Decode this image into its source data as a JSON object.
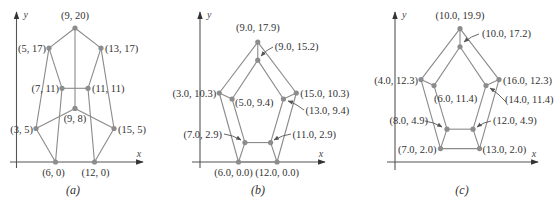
{
  "figure": {
    "panels": [
      {
        "id": "a",
        "caption": "(a)",
        "axes": {
          "x_label": "x",
          "y_label": "y"
        },
        "origin_px": [
          16.5,
          162
        ],
        "scale_px": [
          6.5,
          6.7
        ],
        "axis_px": {
          "x": [
            10,
            143
          ],
          "y": [
            12,
            168
          ]
        },
        "points": [
          {
            "key": "p1",
            "x": 9,
            "y": 20,
            "label": "(9, 20)",
            "lx": 0,
            "ly": -9,
            "anchor": "middle"
          },
          {
            "key": "p2",
            "x": 5,
            "y": 17,
            "label": "(5, 17)",
            "lx": -3,
            "ly": 4,
            "anchor": "end"
          },
          {
            "key": "p3",
            "x": 13,
            "y": 17,
            "label": "(13, 17)",
            "lx": 4,
            "ly": 4,
            "anchor": "start"
          },
          {
            "key": "p4",
            "x": 7,
            "y": 11,
            "label": "(7, 11)",
            "lx": -3,
            "ly": 4,
            "anchor": "end"
          },
          {
            "key": "p5",
            "x": 11,
            "y": 11,
            "label": "(11, 11)",
            "lx": 4,
            "ly": 4,
            "anchor": "start"
          },
          {
            "key": "p6",
            "x": 9,
            "y": 8,
            "label": "(9, 8)",
            "lx": 0,
            "ly": 14,
            "anchor": "middle"
          },
          {
            "key": "p7",
            "x": 3,
            "y": 5,
            "label": "(3, 5)",
            "lx": -3,
            "ly": 4,
            "anchor": "end"
          },
          {
            "key": "p8",
            "x": 15,
            "y": 5,
            "label": "(15, 5)",
            "lx": 4,
            "ly": 4,
            "anchor": "start"
          },
          {
            "key": "p9",
            "x": 6,
            "y": 0,
            "label": "(6, 0)",
            "lx": -2,
            "ly": 14,
            "anchor": "middle"
          },
          {
            "key": "p10",
            "x": 12,
            "y": 0,
            "label": "(12, 0)",
            "lx": 1,
            "ly": 14,
            "anchor": "middle"
          }
        ],
        "edges": [
          [
            "p1",
            "p2"
          ],
          [
            "p1",
            "p3"
          ],
          [
            "p1",
            "p6"
          ],
          [
            "p2",
            "p7"
          ],
          [
            "p2",
            "p4"
          ],
          [
            "p3",
            "p8"
          ],
          [
            "p3",
            "p5"
          ],
          [
            "p4",
            "p5"
          ],
          [
            "p4",
            "p9"
          ],
          [
            "p5",
            "p10"
          ],
          [
            "p7",
            "p6"
          ],
          [
            "p6",
            "p8"
          ],
          [
            "p7",
            "p9"
          ],
          [
            "p8",
            "p10"
          ]
        ],
        "arrows": []
      },
      {
        "id": "b",
        "caption": "(b)",
        "axes": {
          "x_label": "x",
          "y_label": "y"
        },
        "origin_px": [
          200,
          162
        ],
        "scale_px": [
          6.42,
          6.7
        ],
        "axis_px": {
          "x": [
            192,
            325
          ],
          "y": [
            12,
            168
          ]
        },
        "points": [
          {
            "key": "q1",
            "x": 9.0,
            "y": 17.9,
            "label": "(9.0, 17.9)",
            "lx": 0,
            "ly": -11,
            "anchor": "middle"
          },
          {
            "key": "q2",
            "x": 9.0,
            "y": 15.2,
            "label": "(9.0, 15.2)",
            "lx": 17,
            "ly": -10,
            "anchor": "start"
          },
          {
            "key": "q3",
            "x": 3.0,
            "y": 10.3,
            "label": "(3.0, 10.3)",
            "lx": -3,
            "ly": 4,
            "anchor": "end"
          },
          {
            "key": "q4",
            "x": 15.0,
            "y": 10.3,
            "label": "(15.0, 10.3)",
            "lx": 4,
            "ly": 4,
            "anchor": "start"
          },
          {
            "key": "q5",
            "x": 5.0,
            "y": 9.4,
            "label": "(5.0, 9.4)",
            "lx": 3,
            "ly": 7,
            "anchor": "start"
          },
          {
            "key": "q6",
            "x": 13.0,
            "y": 9.4,
            "label": "(13.0, 9.4)",
            "lx": 22,
            "ly": 15,
            "anchor": "start"
          },
          {
            "key": "q7",
            "x": 7.0,
            "y": 2.9,
            "label": "(7.0, 2.9)",
            "lx": -23,
            "ly": -5,
            "anchor": "end"
          },
          {
            "key": "q8",
            "x": 11.0,
            "y": 2.9,
            "label": "(11.0, 2.9)",
            "lx": 22,
            "ly": -5,
            "anchor": "start"
          },
          {
            "key": "q9",
            "x": 6.0,
            "y": 0.0,
            "label": "(6.0, 0.0)",
            "lx": -5,
            "ly": 14,
            "anchor": "middle"
          },
          {
            "key": "q10",
            "x": 12.0,
            "y": 0.0,
            "label": "(12.0, 0.0)",
            "lx": 0,
            "ly": 14,
            "anchor": "middle"
          }
        ],
        "edges": [
          [
            "q1",
            "q3"
          ],
          [
            "q3",
            "q9"
          ],
          [
            "q9",
            "q10"
          ],
          [
            "q10",
            "q4"
          ],
          [
            "q4",
            "q1"
          ],
          [
            "q2",
            "q5"
          ],
          [
            "q5",
            "q7"
          ],
          [
            "q7",
            "q8"
          ],
          [
            "q8",
            "q6"
          ],
          [
            "q6",
            "q2"
          ],
          [
            "q1",
            "q2"
          ],
          [
            "q3",
            "q5"
          ],
          [
            "q4",
            "q6"
          ],
          [
            "q7",
            "q9"
          ],
          [
            "q8",
            "q10"
          ]
        ],
        "arrows": [
          {
            "from": [
              273,
              47
            ],
            "to": [
              261,
              56
            ]
          },
          {
            "from": [
              304,
              110
            ],
            "to": [
              288,
              101
            ]
          },
          {
            "from": [
              224,
              134
            ],
            "to": [
              241,
              140
            ]
          },
          {
            "from": [
              291,
              134
            ],
            "to": [
              274,
              140
            ]
          }
        ]
      },
      {
        "id": "c",
        "caption": "(c)",
        "axes": {
          "x_label": "x",
          "y_label": "y"
        },
        "origin_px": [
          395,
          162
        ],
        "scale_px": [
          6.5,
          6.7
        ],
        "axis_px": {
          "x": [
            387,
            538
          ],
          "y": [
            12,
            170
          ]
        },
        "points": [
          {
            "key": "r1",
            "x": 10.0,
            "y": 19.9,
            "label": "(10.0, 19.9)",
            "lx": 0,
            "ly": -10,
            "anchor": "middle"
          },
          {
            "key": "r2",
            "x": 10.0,
            "y": 17.2,
            "label": "(10.0, 17.2)",
            "lx": 22,
            "ly": -10,
            "anchor": "start"
          },
          {
            "key": "r3",
            "x": 4.0,
            "y": 12.3,
            "label": "(4.0, 12.3)",
            "lx": -3,
            "ly": 4,
            "anchor": "end"
          },
          {
            "key": "r4",
            "x": 16.0,
            "y": 12.3,
            "label": "(16.0, 12.3)",
            "lx": 4,
            "ly": 4,
            "anchor": "start"
          },
          {
            "key": "r5",
            "x": 6.0,
            "y": 11.4,
            "label": "(6.0, 11.4)",
            "lx": 0,
            "ly": 16,
            "anchor": "start"
          },
          {
            "key": "r6",
            "x": 14.0,
            "y": 11.4,
            "label": "(14.0, 11.4)",
            "lx": 19,
            "ly": 17,
            "anchor": "start"
          },
          {
            "key": "r7",
            "x": 8.0,
            "y": 4.9,
            "label": "(8.0, 4.9)",
            "lx": -19,
            "ly": -5,
            "anchor": "end"
          },
          {
            "key": "r8",
            "x": 12.0,
            "y": 4.9,
            "label": "(12.0, 4.9)",
            "lx": 20,
            "ly": -5,
            "anchor": "start"
          },
          {
            "key": "r9",
            "x": 7.0,
            "y": 2.0,
            "label": "(7.0, 2.0)",
            "lx": -4,
            "ly": 4,
            "anchor": "end"
          },
          {
            "key": "r10",
            "x": 13.0,
            "y": 2.0,
            "label": "(13.0, 2.0)",
            "lx": 3,
            "ly": 4,
            "anchor": "start"
          }
        ],
        "edges": [
          [
            "r1",
            "r3"
          ],
          [
            "r3",
            "r9"
          ],
          [
            "r9",
            "r10"
          ],
          [
            "r10",
            "r4"
          ],
          [
            "r4",
            "r1"
          ],
          [
            "r2",
            "r5"
          ],
          [
            "r5",
            "r7"
          ],
          [
            "r7",
            "r8"
          ],
          [
            "r8",
            "r6"
          ],
          [
            "r6",
            "r2"
          ],
          [
            "r1",
            "r2"
          ],
          [
            "r3",
            "r5"
          ],
          [
            "r4",
            "r6"
          ],
          [
            "r7",
            "r9"
          ],
          [
            "r8",
            "r10"
          ]
        ],
        "arrows": [
          {
            "from": [
              479,
              34
            ],
            "to": [
              464,
              42
            ]
          },
          {
            "from": [
              506,
              102
            ],
            "to": [
              490,
              88
            ]
          },
          {
            "from": [
              425,
              121
            ],
            "to": [
              442,
              127
            ]
          },
          {
            "from": [
              491,
              121
            ],
            "to": [
              477,
              127
            ]
          }
        ]
      }
    ]
  }
}
